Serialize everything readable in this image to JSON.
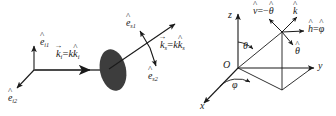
{
  "figure": {
    "background_color": "#ffffff",
    "line_color": "#1a1a1a",
    "scatterer_color": "#3d3d3d"
  },
  "left_diagram": {
    "name": "scattering-geometry",
    "incident_frame": {
      "axis1_label": "e",
      "axis1_sub": "i1",
      "axis1_hat": "^",
      "axis2_label": "e",
      "axis2_sub": "i2",
      "axis2_hat": "^"
    },
    "incident_wavevector": {
      "vector_symbol": "k",
      "vector_sub": "i",
      "vector_arrow": "→",
      "equals": "=",
      "magnitude": "k",
      "unit_symbol": "k",
      "unit_sub": "i",
      "unit_hat": "^",
      "full_text": "k_i = k k̂_i"
    },
    "scattered_frame": {
      "axis1_label": "e",
      "axis1_sub": "s1",
      "axis1_hat": "^",
      "axis2_label": "e",
      "axis2_sub": "s2",
      "axis2_hat": "^"
    },
    "scattered_wavevector": {
      "vector_symbol": "k",
      "vector_sub": "s",
      "vector_arrow": "→",
      "equals": "=",
      "magnitude": "k",
      "unit_symbol": "k",
      "unit_sub": "s",
      "unit_hat": "^",
      "full_text": "k_s = k k̂_s"
    },
    "scatterer": {
      "shape": "ellipse",
      "fill": "#3d3d3d",
      "description": "scattering-target"
    }
  },
  "right_diagram": {
    "name": "spherical-coordinate-frame",
    "axes": {
      "z_label": "z",
      "y_label": "y",
      "x_label": "x",
      "origin_label": "O"
    },
    "angles": {
      "theta_label": "θ",
      "phi_label": "φ"
    },
    "basis_vectors": {
      "k_label": "k",
      "k_hat": "^",
      "v_label": "v",
      "v_hat": "^",
      "v_equals": "=−",
      "v_rhs": "θ",
      "v_rhs_hat": "^",
      "h_label": "h",
      "h_hat": "^",
      "h_equals": "=",
      "h_rhs": "φ",
      "h_rhs_hat": "^",
      "theta_hat_label": "θ",
      "theta_hat_hat": "^"
    }
  }
}
